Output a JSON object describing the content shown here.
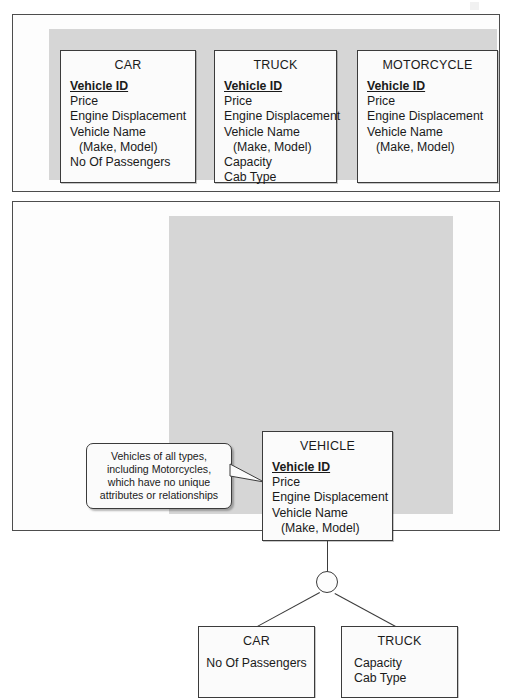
{
  "diagram": {
    "colors": {
      "panel_background": "#fdfdfd",
      "panel_border": "#4d4d4d",
      "grey_band": "#d6d6d6",
      "entity_fill": "#fbfbfb",
      "entity_border": "#3b3b3b",
      "line": "#3b3b3b",
      "text": "#1a1a1a"
    }
  },
  "top_panel": {
    "name": "separate-entities-panel",
    "entities": [
      {
        "title": "CAR",
        "attributes": [
          {
            "text": "Vehicle ID",
            "primary_key": true,
            "indent": false
          },
          {
            "text": "Price",
            "primary_key": false,
            "indent": false
          },
          {
            "text": "Engine Displacement",
            "primary_key": false,
            "indent": false
          },
          {
            "text": "Vehicle Name",
            "primary_key": false,
            "indent": false
          },
          {
            "text": "(Make, Model)",
            "primary_key": false,
            "indent": true
          },
          {
            "text": "No Of Passengers",
            "primary_key": false,
            "indent": false
          }
        ]
      },
      {
        "title": "TRUCK",
        "attributes": [
          {
            "text": "Vehicle ID",
            "primary_key": true,
            "indent": false
          },
          {
            "text": "Price",
            "primary_key": false,
            "indent": false
          },
          {
            "text": "Engine Displacement",
            "primary_key": false,
            "indent": false
          },
          {
            "text": "Vehicle Name",
            "primary_key": false,
            "indent": false
          },
          {
            "text": "(Make, Model)",
            "primary_key": false,
            "indent": true
          },
          {
            "text": "Capacity",
            "primary_key": false,
            "indent": false
          },
          {
            "text": "Cab Type",
            "primary_key": false,
            "indent": false
          }
        ]
      },
      {
        "title": "MOTORCYCLE",
        "attributes": [
          {
            "text": "Vehicle ID",
            "primary_key": true,
            "indent": false
          },
          {
            "text": "Price",
            "primary_key": false,
            "indent": false
          },
          {
            "text": "Engine Displacement",
            "primary_key": false,
            "indent": false
          },
          {
            "text": "Vehicle Name",
            "primary_key": false,
            "indent": false
          },
          {
            "text": "(Make, Model)",
            "primary_key": false,
            "indent": true
          }
        ]
      }
    ]
  },
  "bottom_panel": {
    "name": "generalised-hierarchy-panel",
    "callout": {
      "lines": [
        "Vehicles of all types,",
        "including Motorcycles,",
        "which have no unique",
        "attributes or relationships"
      ]
    },
    "supertype": {
      "title": "VEHICLE",
      "attributes": [
        {
          "text": "Vehicle ID",
          "primary_key": true,
          "indent": false
        },
        {
          "text": "Price",
          "primary_key": false,
          "indent": false
        },
        {
          "text": "Engine Displacement",
          "primary_key": false,
          "indent": false
        },
        {
          "text": "Vehicle Name",
          "primary_key": false,
          "indent": false
        },
        {
          "text": "(Make, Model)",
          "primary_key": false,
          "indent": true
        }
      ]
    },
    "connector": {
      "symbol": "circle",
      "branches": 2
    },
    "subtypes": [
      {
        "title": "CAR",
        "attributes": [
          {
            "text": "No Of Passengers",
            "primary_key": false,
            "indent": false
          }
        ]
      },
      {
        "title": "TRUCK",
        "attributes": [
          {
            "text": "Capacity",
            "primary_key": false,
            "indent": false
          },
          {
            "text": "Cab Type",
            "primary_key": false,
            "indent": false
          }
        ]
      }
    ]
  }
}
